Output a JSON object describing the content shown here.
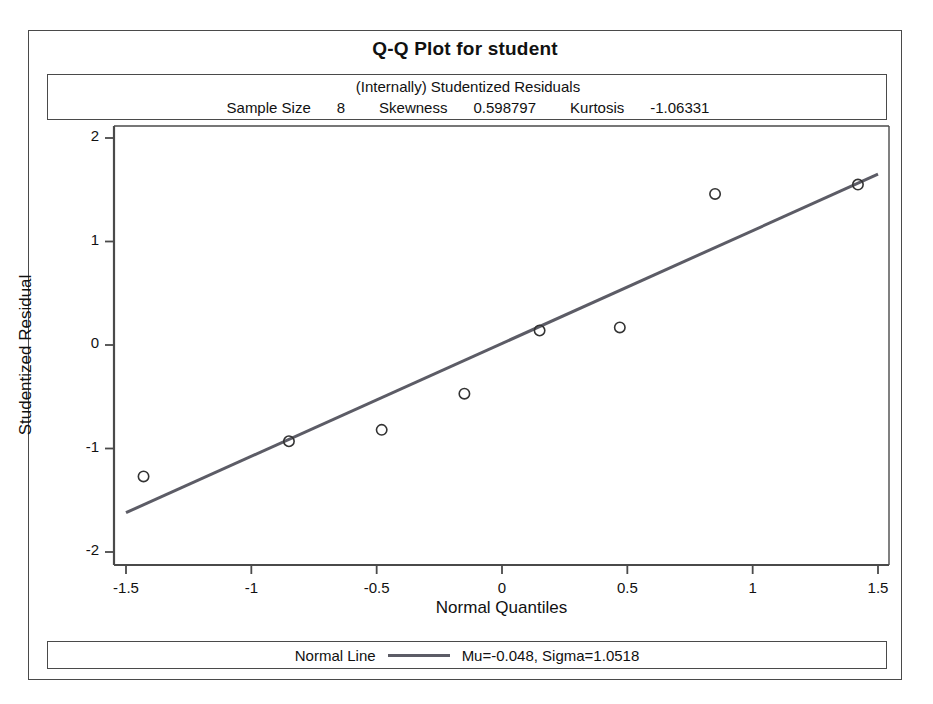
{
  "chart_data": {
    "type": "scatter",
    "title": "Q-Q Plot for student",
    "subtitle": "(Internally) Studentized Residuals",
    "xlabel": "Normal Quantiles",
    "ylabel": "Studentized Residual",
    "xlim": [
      -1.5,
      1.5
    ],
    "ylim": [
      -2,
      2
    ],
    "grid": false,
    "xticks": [
      "-1.5",
      "-1",
      "-0.5",
      "0",
      "0.5",
      "1",
      "1.5"
    ],
    "xtick_values": [
      -1.5,
      -1,
      -0.5,
      0,
      0.5,
      1,
      1.5
    ],
    "yticks": [
      "2",
      "1",
      "0",
      "-1",
      "-2"
    ],
    "ytick_values": [
      2,
      1,
      0,
      -1,
      -2
    ],
    "series": [
      {
        "name": "Studentized Residuals",
        "marker": "open-circle",
        "x": [
          -1.43,
          -0.85,
          -0.48,
          -0.15,
          0.15,
          0.47,
          0.85,
          1.42
        ],
        "y": [
          -1.27,
          -0.93,
          -0.82,
          -0.47,
          0.14,
          0.17,
          1.46,
          1.55
        ]
      }
    ],
    "reference_line": {
      "name": "Normal Line",
      "mu": -0.048,
      "sigma": 1.0518,
      "x0": -1.5,
      "y0": -1.62,
      "x1": 1.5,
      "y1": 1.65,
      "color": "#5c5c66"
    },
    "stats": {
      "sample_size_label": "Sample Size",
      "sample_size_value": "8",
      "skewness_label": "Skewness",
      "skewness_value": "0.598797",
      "kurtosis_label": "Kurtosis",
      "kurtosis_value": "-1.06331"
    },
    "legend": {
      "position": "bottom",
      "series_label": "Normal Line",
      "params_label": "Mu=-0.048, Sigma=1.0518"
    },
    "colors": {
      "frame": "#4a4a4a",
      "line": "#5c5c66",
      "marker_stroke": "#333333",
      "background": "#ffffff",
      "text": "#111111"
    }
  }
}
